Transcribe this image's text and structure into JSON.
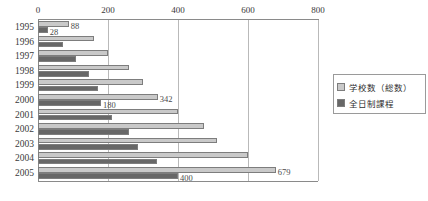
{
  "chart_data": {
    "type": "bar",
    "orientation": "horizontal",
    "title": "",
    "xlabel": "",
    "ylabel": "",
    "xlim": [
      0,
      800
    ],
    "xticks": [
      0,
      200,
      400,
      600,
      800
    ],
    "grid": true,
    "legend_position": "right",
    "categories": [
      "1995",
      "1996",
      "1997",
      "1998",
      "1999",
      "2000",
      "2001",
      "2002",
      "2003",
      "2004",
      "2005"
    ],
    "series": [
      {
        "name": "学校数（総数）",
        "color": "#c9c9c9",
        "values": [
          88,
          160,
          200,
          260,
          300,
          342,
          400,
          475,
          510,
          600,
          679
        ]
      },
      {
        "name": "全日制課程",
        "color": "#676767",
        "values": [
          28,
          70,
          108,
          145,
          170,
          180,
          210,
          260,
          285,
          340,
          400
        ]
      }
    ],
    "point_labels": [
      {
        "category": "1995",
        "series": "学校数（総数）",
        "text": "88"
      },
      {
        "category": "1995",
        "series": "全日制課程",
        "text": "28"
      },
      {
        "category": "2000",
        "series": "学校数（総数）",
        "text": "342"
      },
      {
        "category": "2000",
        "series": "全日制課程",
        "text": "180"
      },
      {
        "category": "2005",
        "series": "学校数（総数）",
        "text": "679"
      },
      {
        "category": "2005",
        "series": "全日制課程",
        "text": "400"
      }
    ]
  },
  "legend": {
    "items": [
      {
        "label": "学校数（総数）"
      },
      {
        "label": "全日制課程"
      }
    ]
  },
  "caption": {
    "text": ""
  }
}
